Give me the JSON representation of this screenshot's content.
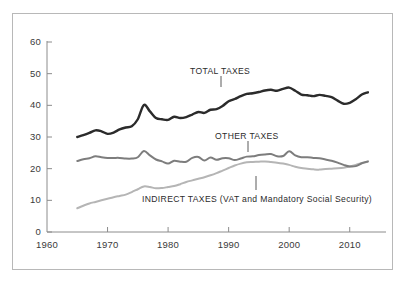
{
  "chart_data": {
    "type": "line",
    "title": "",
    "subtitle": "",
    "xlabel": "",
    "ylabel": "",
    "xlim": [
      1960,
      2015
    ],
    "ylim": [
      0,
      60
    ],
    "xticks": [
      "1960",
      "1970",
      "1980",
      "1990",
      "2000",
      "2010"
    ],
    "yticks": [
      "0",
      "10",
      "20",
      "30",
      "40",
      "50",
      "60"
    ],
    "grid": false,
    "legend_position": "inline-annotations",
    "x": [
      1965,
      1966,
      1967,
      1968,
      1969,
      1970,
      1971,
      1972,
      1973,
      1974,
      1975,
      1976,
      1977,
      1978,
      1979,
      1980,
      1981,
      1982,
      1983,
      1984,
      1985,
      1986,
      1987,
      1988,
      1989,
      1990,
      1991,
      1992,
      1993,
      1994,
      1995,
      1996,
      1997,
      1998,
      1999,
      2000,
      2001,
      2002,
      2003,
      2004,
      2005,
      2006,
      2007,
      2008,
      2009,
      2010,
      2011,
      2012,
      2013
    ],
    "series": [
      {
        "name": "TOTAL TAXES",
        "color": "#2b2b2b",
        "values": [
          30.0,
          30.6,
          31.3,
          32.1,
          31.8,
          31.0,
          31.4,
          32.4,
          33.0,
          33.4,
          35.6,
          40.1,
          38.1,
          36.0,
          35.6,
          35.4,
          36.4,
          36.0,
          36.3,
          37.1,
          37.9,
          37.6,
          38.6,
          38.8,
          39.8,
          41.3,
          42.0,
          42.9,
          43.6,
          43.8,
          44.2,
          44.7,
          44.9,
          44.6,
          45.2,
          45.6,
          44.6,
          43.4,
          43.2,
          42.9,
          43.3,
          43.0,
          42.6,
          41.5,
          40.5,
          40.8,
          41.9,
          43.4,
          44.1
        ]
      },
      {
        "name": "OTHER TAXES",
        "color": "#7d7d7d",
        "values": [
          22.4,
          23.0,
          23.3,
          23.9,
          23.6,
          23.4,
          23.4,
          23.4,
          23.2,
          23.2,
          23.6,
          25.6,
          24.2,
          22.9,
          22.3,
          21.6,
          22.5,
          22.2,
          22.2,
          23.4,
          23.7,
          22.6,
          23.5,
          22.8,
          23.3,
          23.3,
          22.7,
          23.2,
          23.8,
          23.9,
          24.3,
          24.5,
          24.6,
          23.9,
          24.0,
          25.5,
          24.2,
          23.6,
          23.6,
          23.4,
          23.3,
          22.9,
          22.5,
          21.9,
          21.2,
          20.7,
          20.8,
          21.7,
          22.3
        ]
      },
      {
        "name": "INDIRECT TAXES (VAT and Mandatory Social Security)",
        "color": "#b5b5b5",
        "values": [
          7.5,
          8.3,
          9.0,
          9.5,
          10.0,
          10.5,
          11.0,
          11.4,
          11.8,
          12.6,
          13.5,
          14.4,
          14.2,
          13.8,
          13.9,
          14.2,
          14.5,
          15.1,
          15.8,
          16.3,
          16.8,
          17.3,
          17.9,
          18.6,
          19.4,
          20.2,
          21.0,
          21.6,
          22.0,
          22.1,
          22.2,
          22.3,
          22.1,
          21.9,
          21.6,
          21.2,
          20.6,
          20.2,
          20.0,
          19.8,
          19.7,
          19.9,
          20.0,
          20.1,
          20.3,
          20.7,
          21.2,
          21.8,
          22.2
        ]
      }
    ],
    "annotations": [
      {
        "text": "TOTAL TAXES",
        "series": "TOTAL TAXES",
        "label_x_px": 190,
        "label_y_px": 66,
        "leader_x_px": 221,
        "leader_y_top_px": 76,
        "leader_y_bottom_px": 87
      },
      {
        "text": "OTHER TAXES",
        "series": "OTHER TAXES",
        "label_x_px": 215,
        "label_y_px": 131,
        "leader_x_px": 248,
        "leader_y_top_px": 141,
        "leader_y_bottom_px": 152
      },
      {
        "text": "INDIRECT TAXES (VAT and Mandatory Social Security)",
        "series": "INDIRECT TAXES (VAT and Mandatory Social Security)",
        "label_x_px": 142,
        "label_y_px": 194,
        "leader_x_px": 256,
        "leader_y_top_px": 176,
        "leader_y_bottom_px": 190
      }
    ]
  },
  "axes": {
    "axis_color": "#8c8c8c",
    "frame_color": "#b8b8b8",
    "tick_color": "#8c8c8c"
  }
}
